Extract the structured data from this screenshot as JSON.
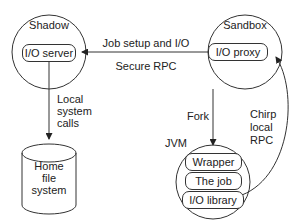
{
  "shadow": {
    "title": "Shadow",
    "component": "I/O server"
  },
  "sandbox": {
    "title": "Sandbox",
    "component": "I/O proxy"
  },
  "link_top": {
    "label_above": "Job setup and I/O",
    "label_below": "Secure RPC"
  },
  "link_local": {
    "lines": [
      "Local",
      "system",
      "calls"
    ]
  },
  "storage": {
    "lines": [
      "Home",
      "file",
      "system"
    ]
  },
  "link_fork": {
    "label": "Fork"
  },
  "jvm": {
    "title": "JVM",
    "layers": [
      "Wrapper",
      "The job",
      "I/O library"
    ]
  },
  "link_chirp": {
    "lines": [
      "Chirp",
      "local",
      "RPC"
    ]
  },
  "colors": {
    "stroke": "#333333",
    "text": "#222222",
    "background": "#ffffff"
  }
}
